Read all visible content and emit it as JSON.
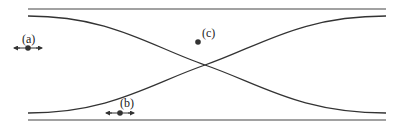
{
  "diagram": {
    "colors": {
      "line": "#444444",
      "curve": "#333333",
      "point": "#333333",
      "text": "#222222"
    },
    "boundaries": {
      "top": {
        "x1": 28,
        "x2": 386,
        "y": 9
      },
      "bottom": {
        "x1": 28,
        "x2": 386,
        "y": 120
      }
    },
    "curves": [
      {
        "name": "descending-curve",
        "from": [
          28,
          16
        ],
        "to": [
          386,
          113
        ]
      },
      {
        "name": "ascending-curve",
        "from": [
          28,
          113
        ],
        "to": [
          386,
          16
        ]
      }
    ],
    "crossing": {
      "x": 205,
      "y": 65
    },
    "points": [
      {
        "id": "a",
        "label": "(a)",
        "x": 28,
        "y": 48,
        "arrows": "horizontal-double"
      },
      {
        "id": "b",
        "label": "(b)",
        "x": 120,
        "y": 113,
        "arrows": "horizontal-double"
      },
      {
        "id": "c",
        "label": "(c)",
        "x": 198,
        "y": 42,
        "arrows": "none"
      }
    ]
  }
}
